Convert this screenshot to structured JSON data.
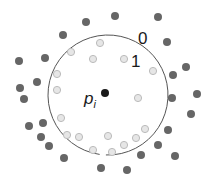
{
  "diagram": {
    "circle": {
      "cx": 108,
      "cy": 95,
      "r": 60,
      "stroke": "#555555",
      "gap_deg": [
        92,
        98
      ]
    },
    "center_point": {
      "x": 105,
      "y": 93,
      "r": 4,
      "color": "#1a1a1a"
    },
    "labels": {
      "center": "p",
      "center_sub": "i",
      "outer_ring": "0",
      "inner_ring": "1"
    },
    "colors": {
      "outer_dot": "#666666",
      "inner_dot_fill": "#e6e6e6",
      "inner_dot_stroke": "#bbbbbb"
    },
    "outer_dots": [
      [
        86,
        22
      ],
      [
        115,
        16
      ],
      [
        158,
        17
      ],
      [
        63,
        35
      ],
      [
        167,
        42
      ],
      [
        45,
        58
      ],
      [
        19,
        61
      ],
      [
        186,
        67
      ],
      [
        173,
        75
      ],
      [
        37,
        82
      ],
      [
        20,
        88
      ],
      [
        24,
        99
      ],
      [
        197,
        94
      ],
      [
        172,
        98
      ],
      [
        191,
        114
      ],
      [
        29,
        126
      ],
      [
        43,
        123
      ],
      [
        168,
        130
      ],
      [
        41,
        137
      ],
      [
        49,
        146
      ],
      [
        158,
        145
      ],
      [
        64,
        158
      ],
      [
        141,
        155
      ],
      [
        175,
        156
      ],
      [
        101,
        168
      ],
      [
        127,
        170
      ]
    ],
    "inner_dots": [
      [
        100,
        43
      ],
      [
        71,
        52
      ],
      [
        93,
        59
      ],
      [
        124,
        59
      ],
      [
        57,
        74
      ],
      [
        153,
        71
      ],
      [
        57,
        90
      ],
      [
        138,
        98
      ],
      [
        61,
        118
      ],
      [
        67,
        135
      ],
      [
        79,
        137
      ],
      [
        108,
        136
      ],
      [
        93,
        150
      ],
      [
        112,
        152
      ],
      [
        124,
        145
      ],
      [
        136,
        138
      ],
      [
        145,
        129
      ]
    ]
  }
}
